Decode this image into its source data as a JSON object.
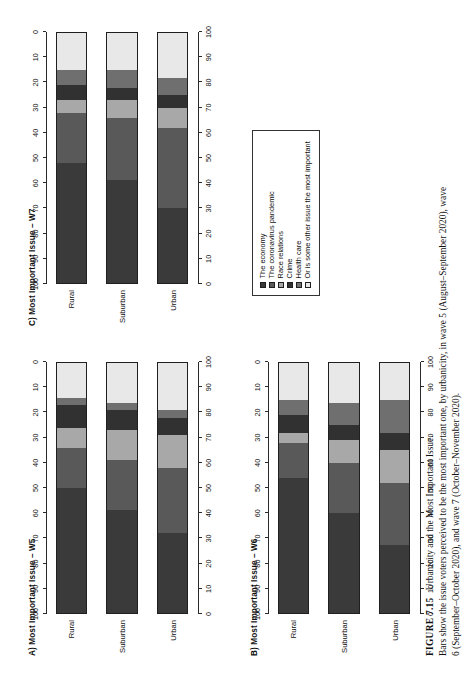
{
  "figure": {
    "number": "FIGURE 7.15",
    "title": "Urbanicity and the Most Important Issue.",
    "caption_lines": [
      "Bars show the issue voters perceived to be the most important one, by urbanicity, in wave 5 (August–September 2020), wave",
      "6 (September–October 2020), and wave 7 (October–November 2020)."
    ]
  },
  "legend": {
    "items": [
      {
        "label": "The economy",
        "color": "#3a3a3a"
      },
      {
        "label": "The coronavirus pandemic",
        "color": "#595959"
      },
      {
        "label": "Race relations",
        "color": "#a8a8a8"
      },
      {
        "label": "Crime",
        "color": "#313131"
      },
      {
        "label": "Health care",
        "color": "#6f6f6f"
      },
      {
        "label": "Or is some other issue the most important",
        "color": "#e8e8e8"
      }
    ]
  },
  "axis": {
    "ticks": [
      0,
      10,
      20,
      30,
      40,
      50,
      60,
      70,
      80,
      90,
      100
    ],
    "reversed_ticks": [
      100,
      90,
      80,
      70,
      60,
      50,
      40,
      30,
      20,
      10,
      0
    ],
    "min": 0,
    "max": 100
  },
  "categories": [
    "Rural",
    "Suburban",
    "Urban"
  ],
  "chart_data": [
    {
      "type": "bar",
      "panel": "A",
      "title": "A) Most Important Issue – W5",
      "orientation": "horizontal-stacked",
      "stacked": true,
      "categories": [
        "Rural",
        "Suburban",
        "Urban"
      ],
      "xlabel": "",
      "ylabel": "",
      "xlim": [
        0,
        100
      ],
      "grid": false,
      "legend_position": "separate-box",
      "series": [
        {
          "name": "The economy",
          "values": [
            50,
            41,
            32
          ]
        },
        {
          "name": "The coronavirus pandemic",
          "values": [
            16,
            20,
            26
          ]
        },
        {
          "name": "Race relations",
          "values": [
            8,
            12,
            13
          ]
        },
        {
          "name": "Crime",
          "values": [
            9,
            8,
            7
          ]
        },
        {
          "name": "Health care",
          "values": [
            3,
            3,
            3
          ]
        },
        {
          "name": "Or is some other issue the most important",
          "values": [
            14,
            16,
            19
          ]
        }
      ]
    },
    {
      "type": "bar",
      "panel": "B",
      "title": "B) Most Important Issue – W6",
      "orientation": "horizontal-stacked",
      "stacked": true,
      "categories": [
        "Rural",
        "Suburban",
        "Urban"
      ],
      "xlabel": "",
      "ylabel": "",
      "xlim": [
        0,
        100
      ],
      "grid": false,
      "legend_position": "separate-box",
      "series": [
        {
          "name": "The economy",
          "values": [
            54,
            40,
            27
          ]
        },
        {
          "name": "The coronavirus pandemic",
          "values": [
            14,
            20,
            25
          ]
        },
        {
          "name": "Race relations",
          "values": [
            4,
            9,
            13
          ]
        },
        {
          "name": "Crime",
          "values": [
            7,
            6,
            7
          ]
        },
        {
          "name": "Health care",
          "values": [
            6,
            9,
            13
          ]
        },
        {
          "name": "Or is some other issue the most important",
          "values": [
            15,
            16,
            15
          ]
        }
      ]
    },
    {
      "type": "bar",
      "panel": "C",
      "title": "C) Most Important Issue – W7",
      "orientation": "horizontal-stacked",
      "stacked": true,
      "categories": [
        "Rural",
        "Suburban",
        "Urban"
      ],
      "xlabel": "",
      "ylabel": "",
      "xlim": [
        0,
        100
      ],
      "grid": false,
      "legend_position": "separate-box",
      "series": [
        {
          "name": "The economy",
          "values": [
            48,
            41,
            30
          ]
        },
        {
          "name": "The coronavirus pandemic",
          "values": [
            20,
            25,
            32
          ]
        },
        {
          "name": "Race relations",
          "values": [
            5,
            7,
            8
          ]
        },
        {
          "name": "Crime",
          "values": [
            6,
            5,
            5
          ]
        },
        {
          "name": "Health care",
          "values": [
            6,
            7,
            7
          ]
        },
        {
          "name": "Or is some other issue the most important",
          "values": [
            15,
            15,
            18
          ]
        }
      ]
    }
  ]
}
